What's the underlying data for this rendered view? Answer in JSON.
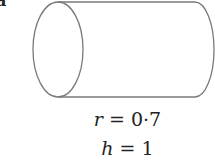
{
  "figure": {
    "part_label": "a",
    "shape": "cylinder",
    "stroke_color": "#7a7a7a",
    "radius": {
      "symbol": "r",
      "equals": "=",
      "value": "0·7"
    },
    "height": {
      "symbol": "h",
      "equals": "=",
      "value": "1"
    }
  }
}
